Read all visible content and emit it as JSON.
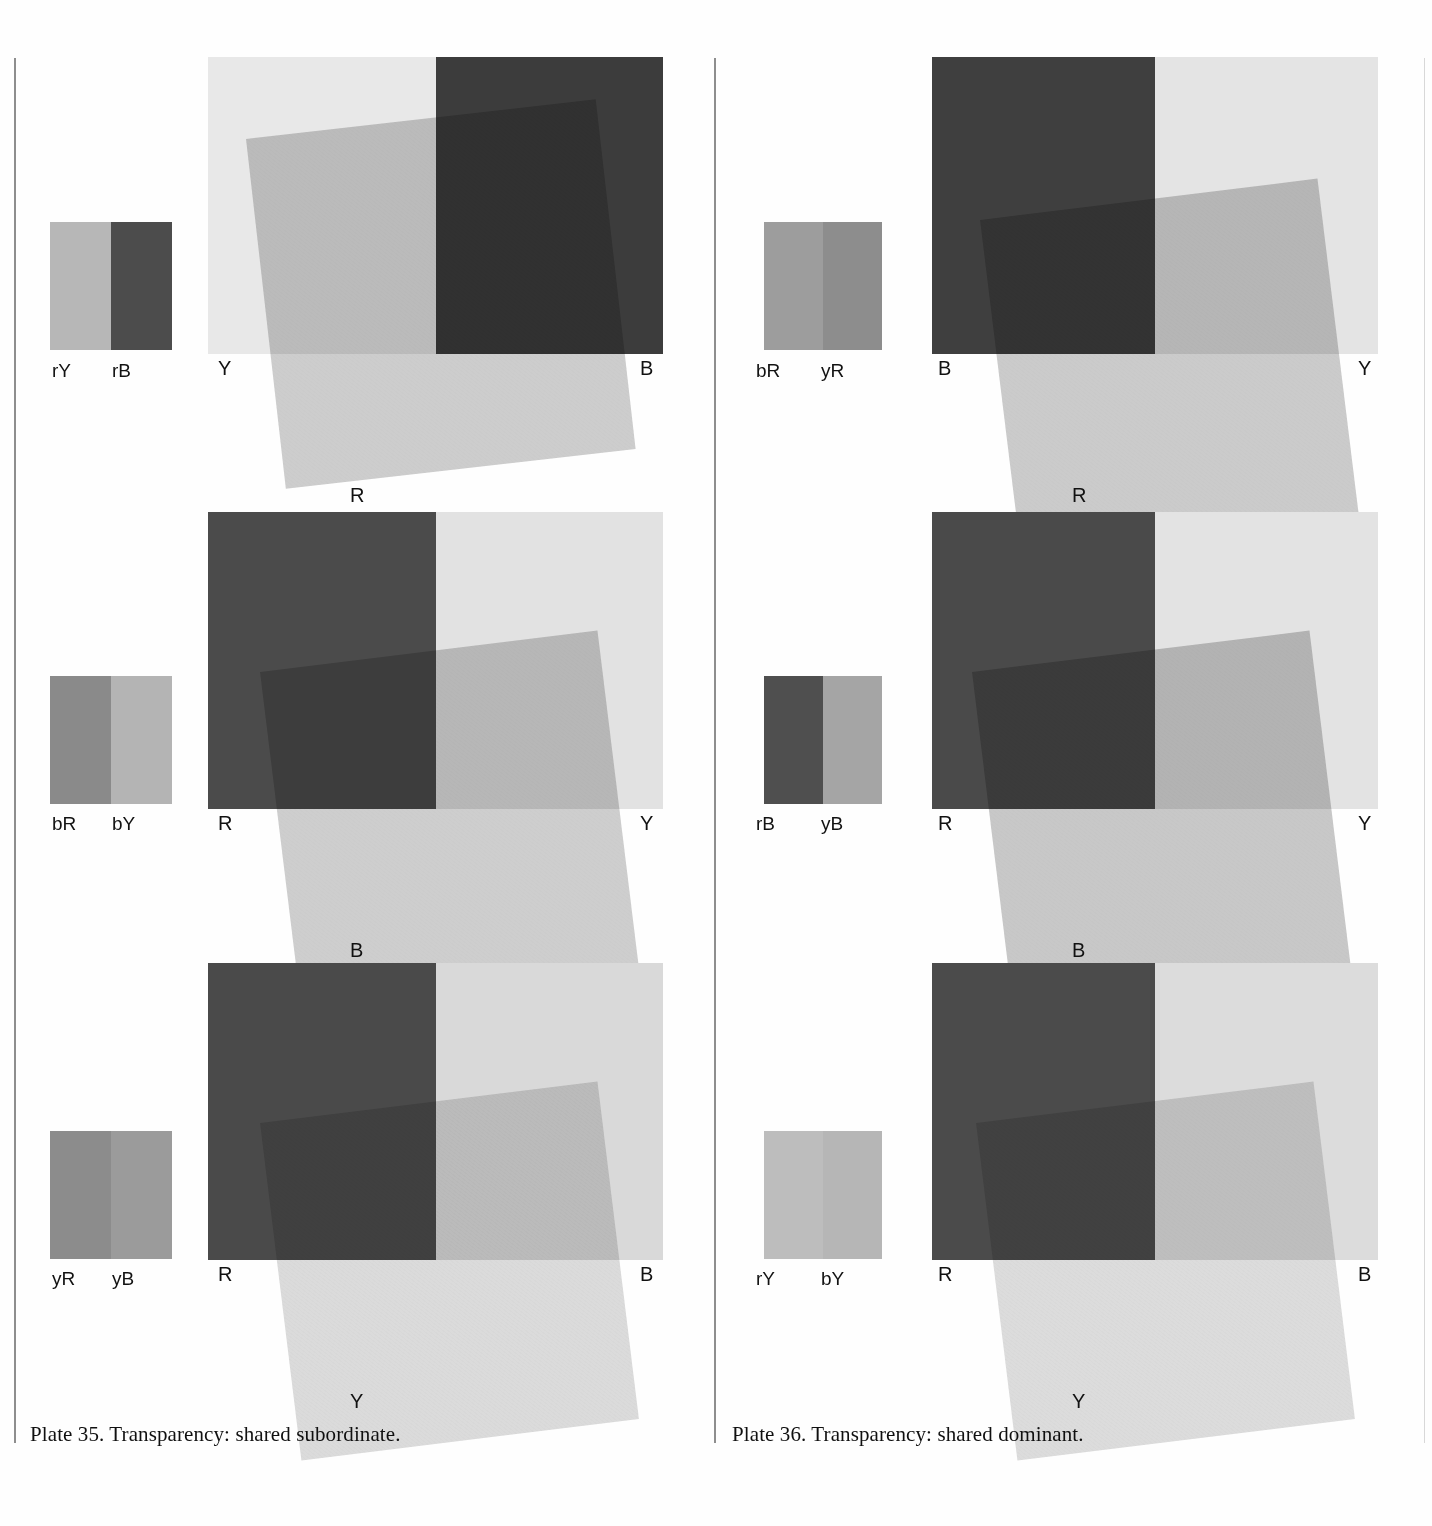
{
  "page": {
    "background": "#fefefe",
    "rule_color": "#8e8e8e"
  },
  "plates": [
    {
      "id": "plate-35",
      "caption": "Plate 35. Transparency: shared subordinate.",
      "rows": [
        {
          "swatches": [
            {
              "label": "rY",
              "color": "#b7b7b7"
            },
            {
              "label": "rB",
              "color": "#4c4c4c"
            }
          ],
          "composition": {
            "left_field": {
              "label": "Y",
              "color": "#e8e8e8"
            },
            "right_field": {
              "label": "B",
              "color": "#3c3c3c"
            },
            "overlay": {
              "label": "R",
              "color": "#b0b0b0",
              "opacity": 0.62
            },
            "labels": {
              "top_left": "Y",
              "top_right": "B",
              "bottom": "R"
            }
          }
        },
        {
          "swatches": [
            {
              "label": "bR",
              "color": "#8a8a8a"
            },
            {
              "label": "bY",
              "color": "#b4b4b4"
            }
          ],
          "composition": {
            "left_field": {
              "label": "R",
              "color": "#4b4b4b"
            },
            "right_field": {
              "label": "Y",
              "color": "#e2e2e2"
            },
            "overlay": {
              "label": "B",
              "color": "#a8a8a8",
              "opacity": 0.55
            },
            "labels": {
              "top_left": "R",
              "top_right": "Y",
              "bottom": "B"
            }
          }
        },
        {
          "swatches": [
            {
              "label": "yR",
              "color": "#8c8c8c"
            },
            {
              "label": "yB",
              "color": "#9b9b9b"
            }
          ],
          "composition": {
            "left_field": {
              "label": "R",
              "color": "#4a4a4a"
            },
            "right_field": {
              "label": "B",
              "color": "#d9d9d9"
            },
            "overlay": {
              "label": "Y",
              "color": "#c4c4c4",
              "opacity": 0.6
            },
            "labels": {
              "top_left": "R",
              "top_right": "B",
              "bottom": "Y"
            }
          }
        }
      ]
    },
    {
      "id": "plate-36",
      "caption": "Plate 36. Transparency: shared dominant.",
      "rows": [
        {
          "swatches": [
            {
              "label": "bR",
              "color": "#9d9d9d"
            },
            {
              "label": "yR",
              "color": "#8d8d8d"
            }
          ],
          "composition": {
            "left_field": {
              "label": "B",
              "color": "#3f3f3f"
            },
            "right_field": {
              "label": "Y",
              "color": "#e4e4e4"
            },
            "overlay": {
              "label": "R",
              "color": "#adadad",
              "opacity": 0.62
            },
            "labels": {
              "top_left": "B",
              "top_right": "Y",
              "bottom": "R"
            }
          }
        },
        {
          "swatches": [
            {
              "label": "rB",
              "color": "#4f4f4f"
            },
            {
              "label": "yB",
              "color": "#a5a5a5"
            }
          ],
          "composition": {
            "left_field": {
              "label": "R",
              "color": "#4a4a4a"
            },
            "right_field": {
              "label": "Y",
              "color": "#e3e3e3"
            },
            "overlay": {
              "label": "B",
              "color": "#9d9d9d",
              "opacity": 0.55
            },
            "labels": {
              "top_left": "R",
              "top_right": "Y",
              "bottom": "B"
            }
          }
        },
        {
          "swatches": [
            {
              "label": "rY",
              "color": "#bdbdbd"
            },
            {
              "label": "bY",
              "color": "#b6b6b6"
            }
          ],
          "composition": {
            "left_field": {
              "label": "R",
              "color": "#4b4b4b"
            },
            "right_field": {
              "label": "B",
              "color": "#dcdcdc"
            },
            "overlay": {
              "label": "Y",
              "color": "#c6c6c6",
              "opacity": 0.6
            },
            "labels": {
              "top_left": "R",
              "top_right": "B",
              "bottom": "Y"
            }
          }
        }
      ]
    }
  ]
}
